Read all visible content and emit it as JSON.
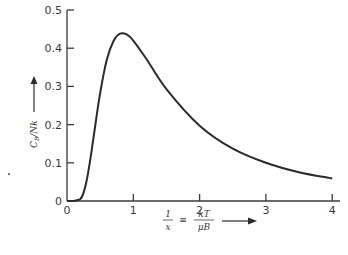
{
  "chart_data": {
    "type": "line",
    "title": "",
    "xlabel": "1/x ≡ kT/μB",
    "ylabel": "C_B/Nk",
    "xlim": [
      0,
      4.1
    ],
    "ylim": [
      0,
      0.5
    ],
    "x_ticks": [
      "0",
      "1",
      "2",
      "3",
      "4"
    ],
    "y_ticks": [
      "0",
      "0.1",
      "0.2",
      "0.3",
      "0.4",
      "0.5"
    ],
    "grid": false,
    "legend": null,
    "series": [
      {
        "name": "C_B/Nk",
        "x": [
          0.1,
          0.2,
          0.25,
          0.3,
          0.35,
          0.4,
          0.5,
          0.6,
          0.7,
          0.8,
          0.9,
          1.0,
          1.2,
          1.5,
          2.0,
          2.5,
          3.0,
          3.5,
          4.0
        ],
        "values": [
          0.0,
          0.005,
          0.022,
          0.057,
          0.107,
          0.166,
          0.283,
          0.37,
          0.418,
          0.438,
          0.436,
          0.42,
          0.371,
          0.293,
          0.197,
          0.137,
          0.1,
          0.075,
          0.059
        ]
      }
    ]
  },
  "labels": {
    "y_axis_lhs": "C",
    "y_axis_sub": "B",
    "y_axis_rhs": "/Nk",
    "x_frac_num": "1",
    "x_frac_den": "x",
    "equiv": "≡",
    "x_rhs_num": "kT",
    "x_rhs_den": "μB"
  },
  "colors": {
    "line": "#2b2b2b",
    "axis": "#3a3a3a",
    "background": "#ffffff"
  }
}
